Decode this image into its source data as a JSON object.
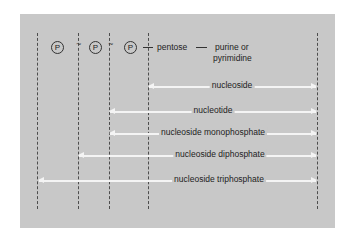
{
  "diagram": {
    "colors": {
      "panel": "#c8c8c8",
      "dashed_lines": "#4d4d4d",
      "arrows": "#f4f4f4",
      "text": "#222222"
    },
    "top_row": {
      "phosphates": [
        "P",
        "P",
        "P"
      ],
      "bond_symbol": "~",
      "pentose": "pentose",
      "base_line1": "purine or",
      "base_line2": "pyrimidine"
    },
    "arrows": [
      {
        "label": "nucleoside",
        "spans_from": "pentose",
        "to": "base"
      },
      {
        "label": "nucleotide",
        "spans_from": "phosphate 3",
        "to": "base"
      },
      {
        "label": "nucleoside monophosphate",
        "spans_from": "phosphate 3",
        "to": "base"
      },
      {
        "label": "nucleoside diphosphate",
        "spans_from": "phosphate 2",
        "to": "base"
      },
      {
        "label": "nucleoside triphosphate",
        "spans_from": "phosphate 1",
        "to": "base"
      }
    ]
  }
}
